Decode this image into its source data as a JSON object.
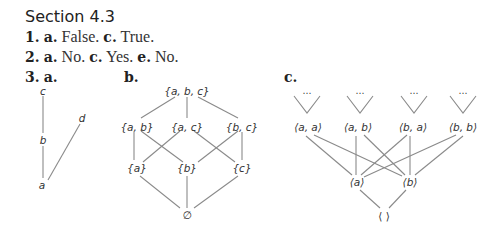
{
  "section": {
    "title": "Section 4.3"
  },
  "answers": [
    {
      "num": "1.",
      "parts": [
        {
          "label": "a.",
          "text": "False."
        },
        {
          "label": "c.",
          "text": "True."
        }
      ]
    },
    {
      "num": "2.",
      "parts": [
        {
          "label": "a.",
          "text": "No."
        },
        {
          "label": "c.",
          "text": "Yes."
        },
        {
          "label": "e.",
          "text": "No."
        }
      ]
    }
  ],
  "problem3": {
    "num": "3.",
    "a": {
      "label": "a.",
      "nodes": {
        "c": "c",
        "b": "b",
        "d": "d",
        "a": "a"
      }
    },
    "b": {
      "label": "b.",
      "nodes": {
        "abc": "{a, b, c}",
        "ab": "{a, b}",
        "ac": "{a, c}",
        "bc": "{b, c}",
        "a": "{a}",
        "b": "{b}",
        "c": "{c}",
        "empty": "∅"
      }
    },
    "c": {
      "label": "c.",
      "ellipsis": "⋯",
      "nodes": {
        "aa": "⟨a, a⟩",
        "ab": "⟨a, b⟩",
        "ba": "⟨b, a⟩",
        "bb": "⟨b, b⟩",
        "a": "⟨a⟩",
        "b": "⟨b⟩",
        "empty": "⟨ ⟩"
      }
    }
  }
}
